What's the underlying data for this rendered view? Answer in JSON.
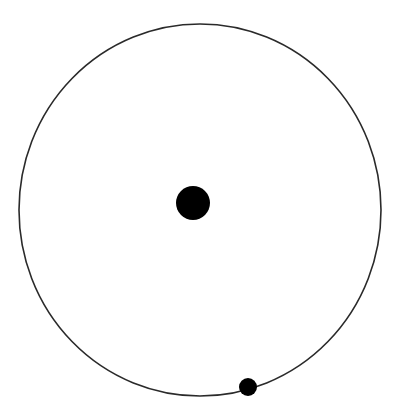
{
  "diagram": {
    "type": "orbit",
    "canvas": {
      "width": 398,
      "height": 416,
      "background": "#ffffff"
    },
    "orbit": {
      "cx": 200,
      "cy": 210,
      "rx": 181,
      "ry": 186,
      "stroke": "#2a2a2a",
      "stroke_width": 1.6
    },
    "central_body": {
      "cx": 193,
      "cy": 203,
      "r": 17,
      "fill": "#000000"
    },
    "orbiting_body": {
      "cx": 248,
      "cy": 387,
      "r": 9,
      "fill": "#000000"
    }
  }
}
